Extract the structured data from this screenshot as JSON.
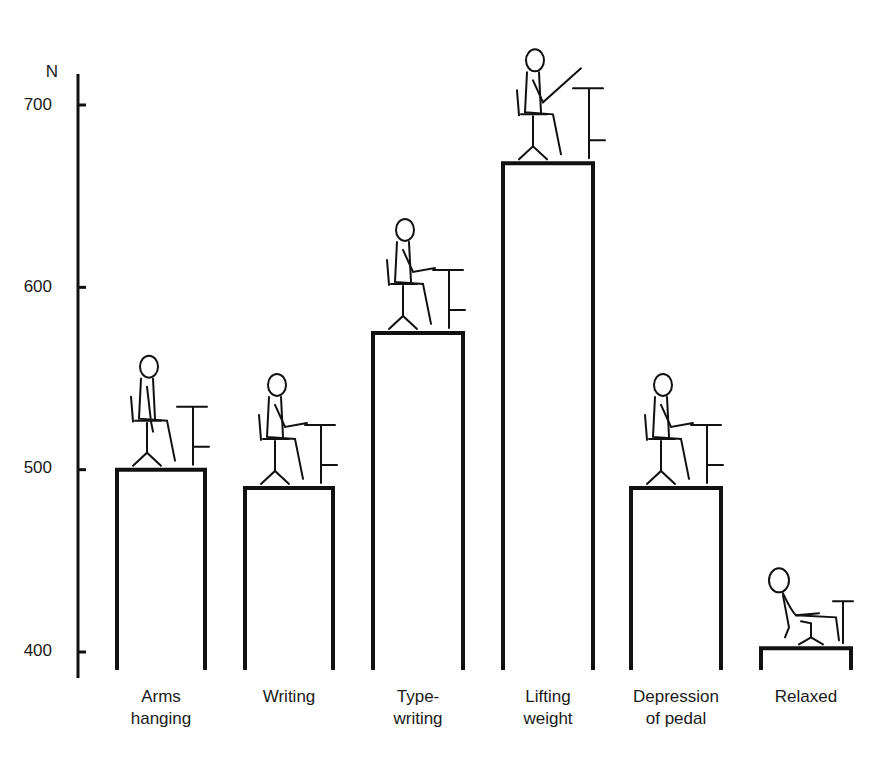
{
  "chart_data": {
    "type": "bar",
    "title": "",
    "xlabel": "",
    "ylabel": "N",
    "ylim": [
      390,
      720
    ],
    "yticks": [
      400,
      500,
      600,
      700
    ],
    "grid": false,
    "legend": null,
    "categories": [
      "Arms hanging",
      "Writing",
      "Type-writing",
      "Lifting weight",
      "Depression of pedal",
      "Relaxed"
    ],
    "category_labels": [
      "Arms\nhanging",
      "Writing",
      "Type-\nwriting",
      "Lifting\nweight",
      "Depression\nof pedal",
      "Relaxed"
    ],
    "values": [
      500,
      490,
      575,
      668,
      490,
      402
    ],
    "annotations": [
      "Each bar is topped by an illustration of a seated person performing the activity"
    ]
  },
  "axis": {
    "unit": "N",
    "ticks": [
      "700",
      "600",
      "500",
      "400"
    ]
  }
}
